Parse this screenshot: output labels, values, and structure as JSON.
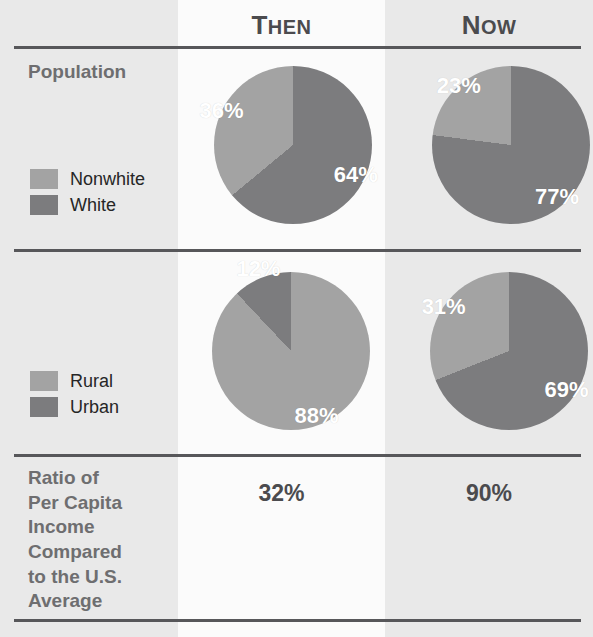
{
  "colors": {
    "light_segment": "#a3a3a3",
    "dark_segment": "#7c7c7e",
    "rule": "#57575a",
    "label_column_bg": "#e9e9e9",
    "then_column_bg": "#fbfbfb",
    "now_column_bg": "#e9e9e9",
    "heading_text": "#4b4b4e",
    "row_title_text": "#6e6e70",
    "legend_text": "#262626",
    "pie_label_text": "#ffffff"
  },
  "header": {
    "label_column": "",
    "then": "Then",
    "then_initial": "T",
    "then_rest": "HEN",
    "now": "Now",
    "now_initial": "N",
    "now_rest": "OW"
  },
  "rows": [
    {
      "title": "Population",
      "legend": [
        {
          "label": "Nonwhite",
          "color": "#a3a3a3"
        },
        {
          "label": "White",
          "color": "#7c7c7e"
        }
      ],
      "then": {
        "slices": [
          {
            "label": "Nonwhite",
            "value": 36,
            "display": "36%"
          },
          {
            "label": "White",
            "value": 64,
            "display": "64%"
          }
        ]
      },
      "now": {
        "slices": [
          {
            "label": "Nonwhite",
            "value": 23,
            "display": "23%"
          },
          {
            "label": "White",
            "value": 77,
            "display": "77%"
          }
        ]
      }
    },
    {
      "title": "",
      "legend": [
        {
          "label": "Rural",
          "color": "#a3a3a3"
        },
        {
          "label": "Urban",
          "color": "#7c7c7e"
        }
      ],
      "then": {
        "slices": [
          {
            "label": "Rural",
            "value": 88,
            "display": "88%"
          },
          {
            "label": "Urban",
            "value": 12,
            "display": "12%"
          }
        ]
      },
      "now": {
        "slices": [
          {
            "label": "Rural",
            "value": 31,
            "display": "31%"
          },
          {
            "label": "Urban",
            "value": 69,
            "display": "69%"
          }
        ]
      }
    },
    {
      "title": "Ratio of Per Capita Income Compared to the U.S. Average",
      "title_lines": [
        "Ratio of",
        "Per Capita",
        "Income",
        "Compared",
        "to the U.S.",
        "Average"
      ],
      "then_value": "32%",
      "now_value": "90%"
    }
  ],
  "chart_data": [
    {
      "type": "pie",
      "title": "Population — Then",
      "categories": [
        "Nonwhite",
        "White"
      ],
      "values": [
        36,
        64
      ],
      "labels": [
        "36%",
        "64%"
      ],
      "colors": [
        "#a3a3a3",
        "#7c7c7e"
      ],
      "legend": "left",
      "start_angle_deg": 0,
      "direction": "clockwise",
      "first_slice": "White"
    },
    {
      "type": "pie",
      "title": "Population — Now",
      "categories": [
        "Nonwhite",
        "White"
      ],
      "values": [
        23,
        77
      ],
      "labels": [
        "23%",
        "77%"
      ],
      "colors": [
        "#a3a3a3",
        "#7c7c7e"
      ],
      "legend": "left",
      "start_angle_deg": 0,
      "direction": "clockwise",
      "first_slice": "White"
    },
    {
      "type": "pie",
      "title": "Rural / Urban — Then",
      "categories": [
        "Rural",
        "Urban"
      ],
      "values": [
        88,
        12
      ],
      "labels": [
        "88%",
        "12%"
      ],
      "colors": [
        "#a3a3a3",
        "#7c7c7e"
      ],
      "legend": "left",
      "start_angle_deg": 0,
      "direction": "clockwise",
      "first_slice": "Rural"
    },
    {
      "type": "pie",
      "title": "Rural / Urban — Now",
      "categories": [
        "Rural",
        "Urban"
      ],
      "values": [
        31,
        69
      ],
      "labels": [
        "31%",
        "69%"
      ],
      "colors": [
        "#a3a3a3",
        "#7c7c7e"
      ],
      "legend": "left",
      "start_angle_deg": 0,
      "direction": "clockwise",
      "first_slice": "Urban"
    },
    {
      "type": "table",
      "title": "Ratio of Per Capita Income Compared to the U.S. Average",
      "categories": [
        "Then",
        "Now"
      ],
      "values": [
        32,
        90
      ],
      "labels": [
        "32%",
        "90%"
      ]
    }
  ]
}
